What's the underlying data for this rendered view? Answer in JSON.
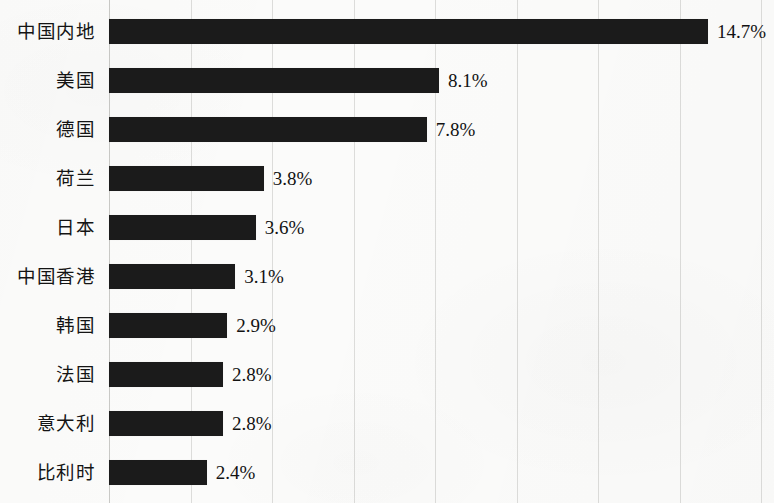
{
  "chart_data": {
    "type": "bar",
    "orientation": "horizontal",
    "title": "",
    "subtitle": "",
    "xlabel": "",
    "ylabel": "",
    "categories": [
      "中国内地",
      "美国",
      "德国",
      "荷兰",
      "日本",
      "中国香港",
      "韩国",
      "法国",
      "意大利",
      "比利时"
    ],
    "values": [
      14.7,
      8.1,
      7.8,
      3.8,
      3.6,
      3.1,
      2.9,
      2.8,
      2.8,
      2.4
    ],
    "value_labels": [
      "14.7%",
      "8.1%",
      "7.8%",
      "3.8%",
      "3.6%",
      "3.1%",
      "2.9%",
      "2.8%",
      "2.8%",
      "2.4%"
    ],
    "unit": "%",
    "xlim": [
      0,
      16
    ],
    "xticks": [
      0,
      2,
      4,
      6,
      8,
      10,
      12,
      14,
      16
    ],
    "xtick_labels": [],
    "grid": "vertical",
    "legend": "none",
    "bar_color": "#1b1b1b",
    "grid_color": "#dcdcda",
    "background_color": "#fbfbfa",
    "text_color": "#141414"
  },
  "axis": {
    "gridline_positions_px": [
      109,
      190.5,
      272,
      353.5,
      435,
      516.5,
      598,
      679.5,
      761
    ],
    "plot_left_px": 109,
    "px_per_unit": 40.75,
    "row_height_px": 49,
    "bar_height_px": 25,
    "first_bar_top_px": 19
  }
}
